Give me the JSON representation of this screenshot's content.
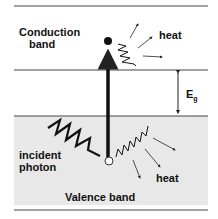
{
  "diagram": {
    "labels": {
      "conduction_line1": "Conduction",
      "conduction_line2": "band",
      "heat_top": "heat",
      "eg": "E",
      "eg_sub": "g",
      "incident_line1": "incident",
      "incident_line2": "photon",
      "heat_bottom": "heat",
      "valence": "Valence band"
    },
    "colors": {
      "line": "#333333",
      "valence_fill": "#e6e6e6",
      "text": "#111111"
    }
  }
}
